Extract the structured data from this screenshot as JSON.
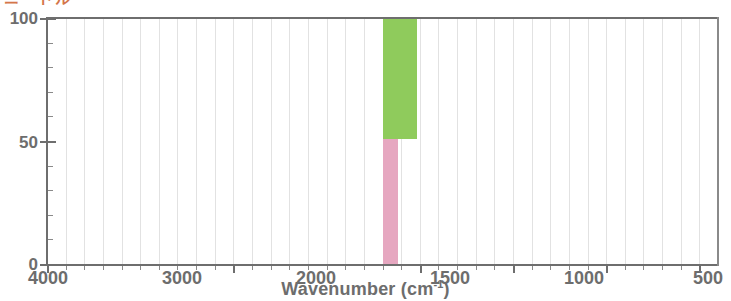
{
  "figure": {
    "heading_text": "ニードル",
    "heading_color": "#d4764a"
  },
  "chart_data": {
    "type": "bar",
    "title": "",
    "subtitle": "",
    "xlabel": "Wavenumber (cm-1)",
    "xlabel_base": "Wavenumber (cm",
    "xlabel_sup": "-1",
    "xlabel_close": ")",
    "ylabel": "",
    "xlim": [
      4000,
      400
    ],
    "ylim": [
      0,
      100
    ],
    "x_ticks": [
      4000,
      3000,
      2000,
      1500,
      1000,
      500
    ],
    "x_tick_labels": [
      "4000",
      "3000",
      "2000",
      "1500",
      "1000",
      "500"
    ],
    "y_ticks": [
      0,
      50,
      100
    ],
    "y_tick_labels": [
      "0",
      "50",
      "100"
    ],
    "y_minor_step": 10,
    "grid": "vertical",
    "legend": "none",
    "axis_direction": "reversed",
    "series": [
      {
        "name": "green-band",
        "color": "#8fcb5c",
        "x_start": 2200,
        "x_end": 2020,
        "y_bottom": 51,
        "y_top": 100
      },
      {
        "name": "pink-band",
        "color": "#e6a7c0",
        "x_start": 2200,
        "x_end": 2120,
        "y_bottom": 0,
        "y_top": 51
      }
    ],
    "values": [
      100,
      51
    ],
    "categories": [
      "green-band",
      "pink-band"
    ]
  },
  "axis_labels": {
    "y": [
      {
        "value": 100,
        "text": "100",
        "top": 9
      },
      {
        "value": 50,
        "text": "50",
        "top": 133
      },
      {
        "value": 0,
        "text": "0",
        "top": 255
      }
    ],
    "x": [
      {
        "value": 4000,
        "text": "4000",
        "center": 48
      },
      {
        "value": 3000,
        "text": "3000",
        "center": 182
      },
      {
        "value": 2000,
        "text": "2000",
        "center": 316
      },
      {
        "value": 1500,
        "text": "1500",
        "center": 450
      },
      {
        "value": 1000,
        "text": "1000",
        "center": 584
      },
      {
        "value": 500,
        "text": "500",
        "center": 708
      }
    ]
  }
}
